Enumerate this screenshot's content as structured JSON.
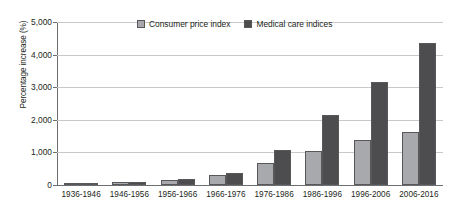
{
  "chart_data": {
    "type": "bar",
    "title": "",
    "subtitle": "",
    "xlabel": "",
    "ylabel": "Percentage increase (%)",
    "ylim": [
      0,
      5000
    ],
    "ytick_labels": [
      "0",
      "1,000",
      "2,000",
      "3,000",
      "4,000",
      "5,000"
    ],
    "ytick_values": [
      0,
      1000,
      2000,
      3000,
      4000,
      5000
    ],
    "grid": true,
    "legend_position": "top-center",
    "categories": [
      "1936-1946",
      "1946-1956",
      "1956-1966",
      "1966-1976",
      "1976-1986",
      "1986-1996",
      "1996-2006",
      "2006-2016"
    ],
    "series": [
      {
        "name": "Consumer price index",
        "color": "#a7a9ac",
        "values": [
          40,
          100,
          150,
          300,
          680,
          1050,
          1380,
          1620
        ]
      },
      {
        "name": "Medical care indices",
        "color": "#4d4d4f",
        "values": [
          30,
          80,
          180,
          380,
          1060,
          2150,
          3150,
          4350
        ]
      }
    ]
  }
}
